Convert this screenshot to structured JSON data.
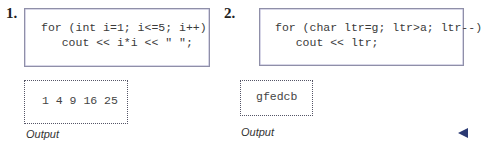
{
  "examples": [
    {
      "number": "1.",
      "code_lines": [
        "for (int i=1; i<=5; i++)",
        "   cout << i*i << \" \";"
      ],
      "output": "1 4 9 16 25",
      "caption": "Output"
    },
    {
      "number": "2.",
      "code_lines": [
        "for (char ltr=g; ltr>a; ltr--)",
        "   cout << ltr;"
      ],
      "output": "gfedcb",
      "caption": "Output"
    }
  ],
  "navigation": {
    "back_icon": "left-triangle-icon",
    "icon_color": "#2b3a73"
  }
}
